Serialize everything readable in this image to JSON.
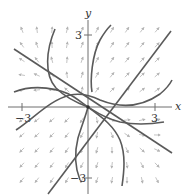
{
  "figure": {
    "type": "phase-portrait",
    "axes": {
      "x_label": "x",
      "y_label": "y",
      "x_ticks": [
        {
          "value": -3,
          "label": "−3"
        },
        {
          "value": 3,
          "label": "3"
        }
      ],
      "y_ticks": [
        {
          "value": 3,
          "label": "3"
        },
        {
          "value": -3,
          "label": "−3"
        }
      ],
      "range": {
        "x": [
          -4,
          4
        ],
        "y": [
          -4,
          4
        ]
      }
    },
    "colors": {
      "trajectory": "#5a5a5a",
      "axis": "#6e6e6e",
      "direction_field": "#b4b4b4",
      "background": "#ffffff"
    },
    "straight_line_solutions": [
      {
        "description": "line with positive slope through origin",
        "slope": 1.3
      },
      {
        "description": "line with negative slope through origin",
        "slope": -0.65
      }
    ],
    "trajectory_count": 4,
    "equilibrium": {
      "x": 0,
      "y": 0
    }
  }
}
